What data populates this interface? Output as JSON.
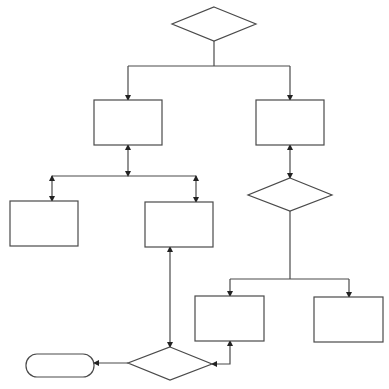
{
  "diagram": {
    "type": "flowchart",
    "stroke_color": "#4a4a4a",
    "background": "#ffffff",
    "nodes": [
      {
        "id": "decision-top",
        "shape": "diamond",
        "label": ""
      },
      {
        "id": "process-left",
        "shape": "rectangle",
        "label": ""
      },
      {
        "id": "process-right",
        "shape": "rectangle",
        "label": ""
      },
      {
        "id": "process-bottom-left-a",
        "shape": "rectangle",
        "label": ""
      },
      {
        "id": "process-bottom-left-b",
        "shape": "rectangle",
        "label": ""
      },
      {
        "id": "decision-right",
        "shape": "diamond",
        "label": ""
      },
      {
        "id": "process-bottom-right-a",
        "shape": "rectangle",
        "label": ""
      },
      {
        "id": "process-bottom-right-b",
        "shape": "rectangle",
        "label": ""
      },
      {
        "id": "decision-bottom",
        "shape": "diamond",
        "label": ""
      },
      {
        "id": "terminator",
        "shape": "rounded-rectangle",
        "label": ""
      }
    ],
    "edges": [
      {
        "from": "decision-top",
        "to": "process-left",
        "arrow": "end"
      },
      {
        "from": "decision-top",
        "to": "process-right",
        "arrow": "end"
      },
      {
        "from": "process-left",
        "to": "junction-left",
        "arrow": "both"
      },
      {
        "from": "junction-left",
        "to": "process-bottom-left-a",
        "arrow": "both"
      },
      {
        "from": "junction-left",
        "to": "process-bottom-left-b",
        "arrow": "both"
      },
      {
        "from": "process-right",
        "to": "decision-right",
        "arrow": "both"
      },
      {
        "from": "decision-right",
        "to": "process-bottom-right-a",
        "arrow": "end"
      },
      {
        "from": "decision-right",
        "to": "process-bottom-right-b",
        "arrow": "end"
      },
      {
        "from": "process-bottom-left-b",
        "to": "decision-bottom",
        "arrow": "both"
      },
      {
        "from": "process-bottom-right-a",
        "to": "decision-bottom",
        "arrow": "both"
      },
      {
        "from": "decision-bottom",
        "to": "terminator",
        "arrow": "end"
      }
    ]
  }
}
